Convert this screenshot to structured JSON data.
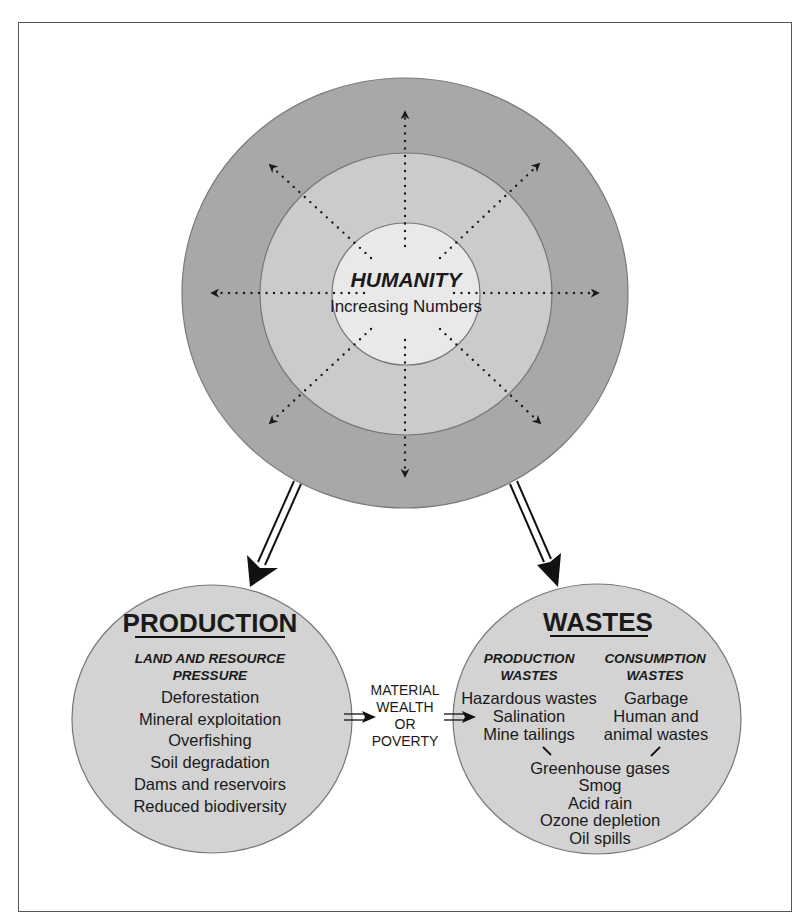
{
  "diagram": {
    "type": "concept-diagram",
    "colors": {
      "outer_ring": "#a8a8a8",
      "middle_ring": "#cbcbcb",
      "inner_circle": "#e9e9e9",
      "lower_circles": "#d3d3d3",
      "ink": "#1a1a1a"
    },
    "humanity": {
      "title": "HUMANITY",
      "subtitle": "Increasing Numbers"
    },
    "connector": {
      "lines": [
        "MATERIAL",
        "WEALTH",
        "OR",
        "POVERTY"
      ]
    },
    "production": {
      "title": "PRODUCTION",
      "subtitle_lines": [
        "LAND AND RESOURCE",
        "PRESSURE"
      ],
      "items": [
        "Deforestation",
        "Mineral exploitation",
        "Overfishing",
        "Soil degradation",
        "Dams and reservoirs",
        "Reduced biodiversity"
      ]
    },
    "wastes": {
      "title": "WASTES",
      "production_wastes": {
        "heading_lines": [
          "PRODUCTION",
          "WASTES"
        ],
        "items": [
          "Hazardous wastes",
          "Salination",
          "Mine tailings"
        ]
      },
      "consumption_wastes": {
        "heading_lines": [
          "CONSUMPTION",
          "WASTES"
        ],
        "items": [
          "Garbage",
          "Human and",
          "animal wastes"
        ]
      },
      "shared_effects": [
        "Greenhouse gases",
        "Smog",
        "Acid rain",
        "Ozone depletion",
        "Oil spills"
      ]
    }
  }
}
